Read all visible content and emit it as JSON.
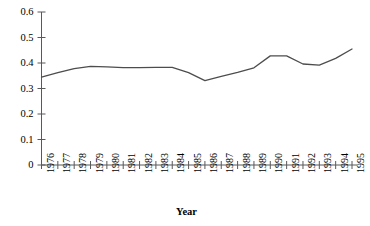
{
  "chart_data": {
    "type": "line",
    "title": "",
    "xlabel": "Year",
    "ylabel": "",
    "categories": [
      "1976",
      "1977",
      "1978",
      "1979",
      "1980",
      "1981",
      "1982",
      "1983",
      "1984",
      "1985",
      "1986",
      "1987",
      "1988",
      "1989",
      "1990",
      "1991",
      "1992",
      "1993",
      "1994",
      "1995"
    ],
    "values": [
      0.345,
      0.362,
      0.378,
      0.387,
      0.385,
      0.382,
      0.382,
      0.383,
      0.383,
      0.362,
      0.331,
      0.348,
      0.363,
      0.381,
      0.428,
      0.428,
      0.396,
      0.392,
      0.418,
      0.455
    ],
    "series": [
      {
        "name": "value",
        "values": [
          0.345,
          0.362,
          0.378,
          0.387,
          0.385,
          0.382,
          0.382,
          0.383,
          0.383,
          0.362,
          0.331,
          0.348,
          0.363,
          0.381,
          0.428,
          0.428,
          0.396,
          0.392,
          0.418,
          0.455
        ]
      }
    ],
    "ylim": [
      0,
      0.6
    ],
    "yticks": [
      0,
      0.1,
      0.2,
      0.3,
      0.4,
      0.5,
      0.6
    ],
    "ytick_labels": [
      "0",
      "0.1",
      "0.2",
      "0.3",
      "0.4",
      "0.5",
      "0.6"
    ],
    "grid": false,
    "legend": false,
    "legend_position": "none",
    "line_color": "#4d4d4d",
    "axis_color": "#595959",
    "background_color": "#ffffff"
  }
}
